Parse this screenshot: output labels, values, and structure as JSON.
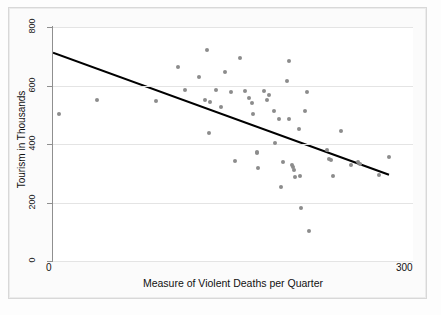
{
  "chart_data": {
    "type": "scatter",
    "title": "",
    "xlabel": "Measure of Violent Deaths per Quarter",
    "ylabel": "Tourism in Thousands",
    "xlim": [
      0,
      300
    ],
    "ylim": [
      0,
      800
    ],
    "xticks": [
      0,
      300
    ],
    "xtick_labels": [
      "0",
      "300"
    ],
    "yticks": [
      0,
      200,
      400,
      600,
      800
    ],
    "ytick_labels": [
      "0",
      "200",
      "400",
      "600",
      "800"
    ],
    "grid": "horizontal",
    "legend": "none",
    "point_color": "#8c8c8c",
    "line_color": "#000000",
    "background_color": "#ffffff",
    "gridline_color": "#e4e4e4",
    "points": [
      [
        5,
        502
      ],
      [
        37,
        551
      ],
      [
        86,
        547
      ],
      [
        104,
        663
      ],
      [
        110,
        585
      ],
      [
        122,
        628
      ],
      [
        128,
        720
      ],
      [
        127,
        549
      ],
      [
        131,
        543
      ],
      [
        130,
        437
      ],
      [
        136,
        583
      ],
      [
        140,
        525
      ],
      [
        143,
        645
      ],
      [
        148,
        578
      ],
      [
        152,
        343
      ],
      [
        156,
        693
      ],
      [
        160,
        580
      ],
      [
        163,
        558
      ],
      [
        166,
        540
      ],
      [
        167,
        504
      ],
      [
        170,
        369
      ],
      [
        170,
        374
      ],
      [
        171,
        318
      ],
      [
        176,
        581
      ],
      [
        178,
        552
      ],
      [
        180,
        566
      ],
      [
        184,
        514
      ],
      [
        185,
        403
      ],
      [
        188,
        485
      ],
      [
        190,
        252
      ],
      [
        192,
        338
      ],
      [
        195,
        615
      ],
      [
        197,
        684
      ],
      [
        197,
        484
      ],
      [
        199,
        327
      ],
      [
        200,
        320
      ],
      [
        201,
        312
      ],
      [
        202,
        286
      ],
      [
        205,
        452
      ],
      [
        206,
        292
      ],
      [
        207,
        180
      ],
      [
        210,
        513
      ],
      [
        212,
        578
      ],
      [
        213,
        102
      ],
      [
        228,
        379
      ],
      [
        230,
        350
      ],
      [
        232,
        345
      ],
      [
        233,
        290
      ],
      [
        240,
        444
      ],
      [
        248,
        327
      ],
      [
        254,
        337
      ],
      [
        256,
        333
      ],
      [
        272,
        293
      ],
      [
        280,
        357
      ]
    ],
    "trend_line": {
      "x0": 0,
      "y0": 712,
      "x1": 280,
      "y1": 295
    }
  }
}
